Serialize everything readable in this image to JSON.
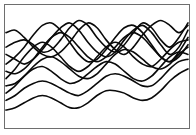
{
  "figure": {
    "background_color": "#ffffff",
    "frame_color": "#6e6e6e",
    "width": 196,
    "height": 135
  },
  "chart_data": {
    "type": "line",
    "title": "",
    "subtitle": "",
    "xlabel": "",
    "ylabel": "",
    "grid": false,
    "legend": "none",
    "xlim": [
      0,
      100
    ],
    "ylim": [
      0,
      100
    ],
    "tick_labels": {
      "x": [],
      "y": []
    },
    "annotations": [],
    "line_color": "#0a0a0a",
    "line_width": 1.6,
    "x": [
      0,
      5,
      10,
      15,
      20,
      25,
      30,
      35,
      40,
      45,
      50,
      55,
      60,
      65,
      70,
      75,
      80,
      85,
      90,
      95,
      100
    ],
    "series": [
      {
        "name": "series-1",
        "values": [
          78,
          80,
          74,
          66,
          60,
          58,
          62,
          70,
          80,
          86,
          82,
          72,
          64,
          60,
          66,
          76,
          84,
          88,
          84,
          78,
          84
        ]
      },
      {
        "name": "series-2",
        "values": [
          66,
          70,
          72,
          68,
          62,
          64,
          72,
          82,
          88,
          84,
          74,
          66,
          62,
          68,
          78,
          86,
          82,
          72,
          66,
          74,
          86
        ]
      },
      {
        "name": "series-3",
        "values": [
          60,
          56,
          52,
          56,
          64,
          74,
          82,
          86,
          80,
          70,
          62,
          58,
          62,
          72,
          80,
          84,
          78,
          68,
          60,
          66,
          80
        ]
      },
      {
        "name": "series-4",
        "values": [
          52,
          58,
          66,
          76,
          84,
          86,
          80,
          70,
          60,
          54,
          56,
          64,
          74,
          82,
          84,
          78,
          68,
          58,
          54,
          62,
          74
        ]
      },
      {
        "name": "series-5",
        "values": [
          46,
          44,
          48,
          56,
          66,
          74,
          78,
          74,
          66,
          58,
          54,
          58,
          66,
          74,
          78,
          74,
          66,
          58,
          54,
          58,
          68
        ]
      },
      {
        "name": "series-6",
        "values": [
          40,
          48,
          58,
          66,
          70,
          66,
          58,
          50,
          46,
          50,
          58,
          66,
          70,
          66,
          58,
          52,
          50,
          56,
          64,
          70,
          72
        ]
      },
      {
        "name": "series-7",
        "values": [
          34,
          36,
          42,
          50,
          56,
          58,
          54,
          48,
          42,
          40,
          44,
          52,
          60,
          64,
          62,
          56,
          50,
          48,
          52,
          60,
          66
        ]
      },
      {
        "name": "series-8",
        "values": [
          28,
          34,
          42,
          48,
          50,
          46,
          40,
          36,
          38,
          44,
          50,
          54,
          52,
          46,
          40,
          38,
          42,
          50,
          58,
          62,
          60
        ]
      },
      {
        "name": "series-9",
        "values": [
          22,
          26,
          32,
          36,
          38,
          36,
          32,
          28,
          26,
          30,
          36,
          42,
          44,
          42,
          38,
          34,
          34,
          40,
          48,
          54,
          56
        ]
      },
      {
        "name": "series-10",
        "values": [
          14,
          16,
          20,
          24,
          26,
          24,
          20,
          16,
          16,
          20,
          26,
          30,
          30,
          28,
          24,
          22,
          24,
          30,
          38,
          44,
          48
        ]
      }
    ]
  }
}
